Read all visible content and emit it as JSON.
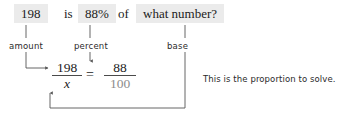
{
  "sentence": {
    "amount_value": "198",
    "is_word": "is",
    "percent_value": "88%",
    "of_word": "of",
    "base_question": "what number?"
  },
  "annotations": {
    "amount_label": "amount",
    "percent_label": "percent",
    "base_label": "base",
    "note": "This is the proportion to solve."
  },
  "equation": {
    "left_numerator": "198",
    "left_denominator": "x",
    "equals": "=",
    "right_numerator": "88",
    "right_denominator": "100"
  },
  "colors": {
    "highlight": "#ebebeb",
    "ink": "#1b1b1b",
    "muted": "#8c8c8c",
    "rule": "#4a4a4a",
    "connector": "#555555",
    "background": "#ffffff"
  }
}
